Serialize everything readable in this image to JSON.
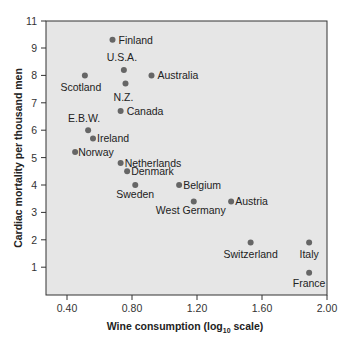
{
  "chart_data": {
    "type": "scatter",
    "title": "",
    "xlabel": "Wine consumption (log10 scale)",
    "xlabel_parts": {
      "pre": "Wine consumption (log",
      "sub": "10",
      "post": " scale)"
    },
    "ylabel": "Cardiac mortality per thousand men",
    "xlim": [
      0.27,
      2.0
    ],
    "ylim": [
      0,
      10.3
    ],
    "x_ticks": [
      0.4,
      0.8,
      1.2,
      1.6,
      2.0
    ],
    "x_tick_labels": [
      "0.40",
      "0.80",
      "1.20",
      "1.60",
      "2.00"
    ],
    "y_ticks": [
      1,
      2,
      3,
      4,
      5,
      6,
      7,
      8,
      9,
      11
    ],
    "y_tick_labels": [
      "1",
      "2",
      "3",
      "4",
      "5",
      "6",
      "7",
      "8",
      "9",
      "11"
    ],
    "grid": false,
    "legend": "none",
    "background": "#e6e6e6",
    "point_color": "#666666",
    "points": [
      {
        "label": "Finland",
        "x": 0.68,
        "y": 9.3,
        "lx": 6,
        "ly": 4,
        "anchor": "start"
      },
      {
        "label": "U.S.A.",
        "x": 0.75,
        "y": 8.2,
        "lx": -2,
        "ly": -9,
        "anchor": "middle"
      },
      {
        "label": "Australia",
        "x": 0.92,
        "y": 8.0,
        "lx": 6,
        "ly": 4,
        "anchor": "start"
      },
      {
        "label": "Scotland",
        "x": 0.51,
        "y": 8.0,
        "lx": -4,
        "ly": 16,
        "anchor": "middle"
      },
      {
        "label": "N.Z.",
        "x": 0.76,
        "y": 7.7,
        "lx": -2,
        "ly": 17,
        "anchor": "middle"
      },
      {
        "label": "Canada",
        "x": 0.73,
        "y": 6.7,
        "lx": 6,
        "ly": 4,
        "anchor": "start"
      },
      {
        "label": "E.B.W.",
        "x": 0.53,
        "y": 6.0,
        "lx": -4,
        "ly": -8,
        "anchor": "middle"
      },
      {
        "label": "Ireland",
        "x": 0.56,
        "y": 5.7,
        "lx": 4,
        "ly": 4,
        "anchor": "start"
      },
      {
        "label": "Norway",
        "x": 0.45,
        "y": 5.2,
        "lx": 3,
        "ly": 4,
        "anchor": "start"
      },
      {
        "label": "Netherlands",
        "x": 0.73,
        "y": 4.8,
        "lx": 4,
        "ly": 4,
        "anchor": "start"
      },
      {
        "label": "Denmark",
        "x": 0.77,
        "y": 4.5,
        "lx": 4,
        "ly": 4,
        "anchor": "start"
      },
      {
        "label": "Sweden",
        "x": 0.82,
        "y": 4.0,
        "lx": 0,
        "ly": 13,
        "anchor": "middle"
      },
      {
        "label": "Belgium",
        "x": 1.09,
        "y": 4.0,
        "lx": 4,
        "ly": 4,
        "anchor": "start"
      },
      {
        "label": "West Germany",
        "x": 1.18,
        "y": 3.4,
        "lx": -3,
        "ly": 13,
        "anchor": "middle"
      },
      {
        "label": "Austria",
        "x": 1.41,
        "y": 3.4,
        "lx": 4,
        "ly": 4,
        "anchor": "start"
      },
      {
        "label": "Switzerland",
        "x": 1.53,
        "y": 1.9,
        "lx": 0,
        "ly": 15,
        "anchor": "middle"
      },
      {
        "label": "Italy",
        "x": 1.89,
        "y": 1.9,
        "lx": 0,
        "ly": 15,
        "anchor": "middle"
      },
      {
        "label": "France",
        "x": 1.89,
        "y": 0.8,
        "lx": 0,
        "ly": 14,
        "anchor": "middle"
      }
    ]
  }
}
